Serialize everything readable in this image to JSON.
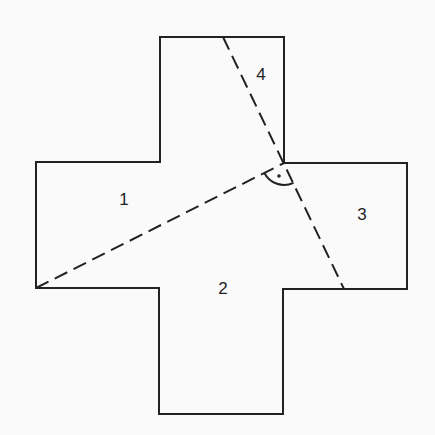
{
  "diagram": {
    "shape": "cross",
    "stroke_color": "#222222",
    "background": "#fafafa",
    "outline_points": [
      [
        160,
        37
      ],
      [
        284,
        37
      ],
      [
        284,
        163
      ],
      [
        407,
        163
      ],
      [
        407,
        289
      ],
      [
        283,
        289
      ],
      [
        283,
        414
      ],
      [
        159,
        414
      ],
      [
        159,
        288
      ],
      [
        36,
        288
      ],
      [
        36,
        162
      ],
      [
        160,
        162
      ]
    ],
    "dashed_lines": [
      {
        "from": [
          36,
          288
        ],
        "to": [
          284,
          163
        ]
      },
      {
        "from": [
          223,
          37
        ],
        "to": [
          344,
          289
        ]
      }
    ],
    "right_angle_marker": {
      "center": [
        284,
        163
      ],
      "radius": 22,
      "dot": [
        274,
        172
      ]
    },
    "regions": [
      {
        "label": "1",
        "x": 124,
        "y": 200
      },
      {
        "label": "2",
        "x": 223,
        "y": 289
      },
      {
        "label": "3",
        "x": 362,
        "y": 215
      },
      {
        "label": "4",
        "x": 261,
        "y": 75
      }
    ]
  }
}
